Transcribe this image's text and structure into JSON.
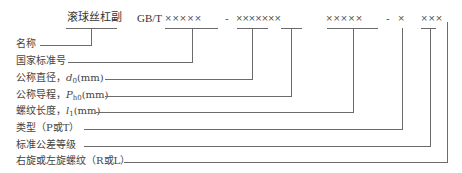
{
  "header": {
    "name": "滚球丝杠副",
    "standard_prefix": "GB/T",
    "code_group_1": "×××××",
    "dash_1": "-",
    "code_group_2": "×××××××",
    "code_group_3": "×××××",
    "dash_2": "-",
    "code_group_4": "×",
    "code_group_5": "×××"
  },
  "labels": [
    {
      "text": "名称"
    },
    {
      "text": "国家标准号"
    },
    {
      "prefix": "公称直径，",
      "symbol": "d",
      "sub": "0",
      "unit": "(mm)"
    },
    {
      "prefix": "公称导程，",
      "symbol": "P",
      "sub": "h0",
      "unit": "(mm)"
    },
    {
      "prefix": "螺纹长度，",
      "symbol": "l",
      "sub": "1",
      "unit": "(mm)"
    },
    {
      "text": "类型（P或T）"
    },
    {
      "text": "标准公差等级"
    },
    {
      "text": "右旋或左旋螺纹（R或L）"
    }
  ]
}
